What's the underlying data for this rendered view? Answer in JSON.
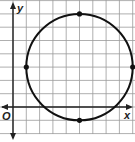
{
  "figure": {
    "type": "coordinate-plane-circle",
    "axes": {
      "x_label": "x",
      "y_label": "y",
      "origin_label": "O"
    },
    "grid": {
      "x_min": -1,
      "x_max": 9,
      "y_min": -2,
      "y_max": 8,
      "step": 1
    },
    "circle": {
      "center": [
        5,
        3
      ],
      "radius": 4
    },
    "points": [
      {
        "name": "top",
        "x": 5,
        "y": 7
      },
      {
        "name": "bottom",
        "x": 5,
        "y": -1
      },
      {
        "name": "left",
        "x": 1,
        "y": 3
      },
      {
        "name": "right",
        "x": 9,
        "y": 3
      }
    ],
    "colors": {
      "grid": "#9a9a9a",
      "axis": "#222222",
      "curve": "#111111"
    }
  }
}
